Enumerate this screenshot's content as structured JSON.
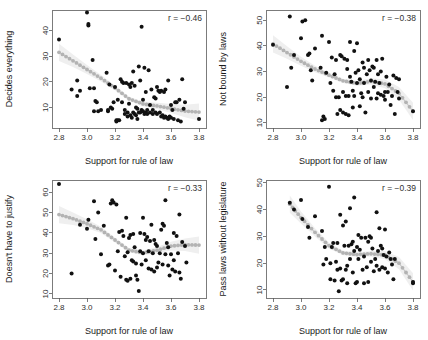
{
  "figure": {
    "type": "scatter-plot-matrix",
    "panel_count": 4,
    "background_color": "#ffffff",
    "point_color": "#111111",
    "smoother_color": "#b3b3b3"
  },
  "chart_data": [
    {
      "id": "decides-everything",
      "type": "scatter",
      "title": "",
      "xlabel": "Support for rule of law",
      "ylabel": "Decides everything",
      "annotation": "r = −0.46",
      "correlation": -0.46,
      "xlim": [
        2.75,
        3.85
      ],
      "ylim": [
        2,
        48
      ],
      "xticks": [
        "2.8",
        "3.0",
        "3.2",
        "3.4",
        "3.6",
        "3.8"
      ],
      "xtick_values": [
        2.8,
        3.0,
        3.2,
        3.4,
        3.6,
        3.8
      ],
      "yticks": [
        "10",
        "20",
        "30",
        "40"
      ],
      "ytick_values": [
        10,
        20,
        30,
        40
      ],
      "grid": false,
      "legend": "none",
      "x": [
        2.8,
        2.89,
        2.93,
        2.93,
        2.95,
        3.0,
        3.01,
        3.01,
        3.02,
        3.04,
        3.05,
        3.05,
        3.06,
        3.07,
        3.08,
        3.1,
        3.14,
        3.15,
        3.15,
        3.16,
        3.17,
        3.18,
        3.19,
        3.2,
        3.21,
        3.21,
        3.22,
        3.22,
        3.23,
        3.24,
        3.25,
        3.25,
        3.26,
        3.27,
        3.27,
        3.28,
        3.29,
        3.29,
        3.3,
        3.3,
        3.31,
        3.31,
        3.32,
        3.32,
        3.33,
        3.33,
        3.34,
        3.34,
        3.35,
        3.35,
        3.36,
        3.36,
        3.37,
        3.37,
        3.38,
        3.38,
        3.39,
        3.39,
        3.4,
        3.4,
        3.41,
        3.41,
        3.42,
        3.42,
        3.43,
        3.43,
        3.44,
        3.45,
        3.45,
        3.46,
        3.47,
        3.47,
        3.48,
        3.49,
        3.49,
        3.5,
        3.5,
        3.51,
        3.52,
        3.52,
        3.53,
        3.53,
        3.54,
        3.55,
        3.55,
        3.56,
        3.56,
        3.57,
        3.58,
        3.58,
        3.59,
        3.6,
        3.6,
        3.61,
        3.62,
        3.63,
        3.64,
        3.65,
        3.66,
        3.67,
        3.68,
        3.69,
        3.7,
        3.8
      ],
      "y": [
        36.5,
        17.0,
        20.5,
        14.5,
        16.5,
        47.0,
        42.0,
        42.5,
        17.5,
        28.5,
        17.5,
        8.5,
        12.5,
        12.0,
        8.5,
        9.0,
        23.5,
        8.5,
        9.0,
        19.0,
        10.0,
        9.5,
        12.0,
        18.0,
        5.0,
        4.5,
        5.0,
        13.0,
        5.0,
        21.0,
        20.0,
        12.0,
        19.5,
        9.0,
        7.5,
        19.5,
        8.0,
        6.5,
        19.0,
        11.5,
        18.0,
        7.0,
        19.5,
        6.0,
        8.0,
        24.0,
        18.5,
        7.5,
        10.0,
        7.0,
        9.5,
        5.5,
        26.0,
        8.0,
        20.5,
        8.0,
        41.5,
        9.0,
        13.0,
        8.5,
        25.5,
        7.5,
        16.0,
        8.0,
        9.0,
        7.5,
        24.5,
        11.0,
        8.0,
        17.0,
        9.0,
        7.5,
        14.0,
        13.5,
        8.0,
        18.0,
        7.5,
        16.5,
        16.0,
        8.0,
        16.5,
        6.5,
        7.0,
        16.0,
        6.0,
        17.0,
        6.5,
        6.0,
        20.5,
        5.5,
        6.5,
        11.0,
        6.0,
        9.0,
        5.5,
        12.0,
        12.0,
        5.0,
        13.0,
        4.5,
        21.0,
        9.5,
        12.0,
        5.5
      ],
      "smoother": {
        "x": [
          2.8,
          2.9,
          3.0,
          3.1,
          3.2,
          3.3,
          3.4,
          3.5,
          3.6,
          3.7,
          3.8
        ],
        "y": [
          31.5,
          28.2,
          24.8,
          21.4,
          17.6,
          13.4,
          11.4,
          10.6,
          9.6,
          8.6,
          8.2
        ]
      }
    },
    {
      "id": "not-bound-by-laws",
      "type": "scatter",
      "title": "",
      "xlabel": "Support for rule of law",
      "ylabel": "Not bound by laws",
      "annotation": "r = −0.38",
      "correlation": -0.38,
      "xlim": [
        2.75,
        3.85
      ],
      "ylim": [
        8,
        54
      ],
      "xticks": [
        "2.8",
        "3.0",
        "3.2",
        "3.4",
        "3.6",
        "3.8"
      ],
      "xtick_values": [
        2.8,
        3.0,
        3.2,
        3.4,
        3.6,
        3.8
      ],
      "yticks": [
        "10",
        "20",
        "30",
        "40",
        "50"
      ],
      "ytick_values": [
        10,
        20,
        30,
        40,
        50
      ],
      "grid": false,
      "legend": "none",
      "x": [
        2.8,
        2.9,
        2.92,
        2.93,
        2.95,
        3.0,
        3.01,
        3.03,
        3.05,
        3.06,
        3.07,
        3.08,
        3.1,
        3.14,
        3.15,
        3.15,
        3.16,
        3.17,
        3.18,
        3.2,
        3.21,
        3.22,
        3.23,
        3.24,
        3.25,
        3.25,
        3.26,
        3.27,
        3.28,
        3.28,
        3.29,
        3.3,
        3.3,
        3.31,
        3.32,
        3.32,
        3.33,
        3.33,
        3.34,
        3.34,
        3.35,
        3.35,
        3.36,
        3.37,
        3.37,
        3.38,
        3.38,
        3.39,
        3.4,
        3.4,
        3.41,
        3.42,
        3.42,
        3.43,
        3.44,
        3.44,
        3.45,
        3.45,
        3.46,
        3.47,
        3.48,
        3.48,
        3.49,
        3.5,
        3.5,
        3.51,
        3.52,
        3.52,
        3.53,
        3.54,
        3.54,
        3.55,
        3.55,
        3.56,
        3.57,
        3.57,
        3.58,
        3.59,
        3.6,
        3.6,
        3.61,
        3.62,
        3.63,
        3.64,
        3.65,
        3.66,
        3.67,
        3.68,
        3.69,
        3.7,
        3.7,
        3.8
      ],
      "y": [
        40.5,
        24.0,
        51.5,
        31.5,
        36.5,
        43.0,
        49.5,
        50.0,
        36.5,
        37.0,
        30.5,
        26.5,
        39.0,
        31.5,
        44.0,
        11.0,
        12.5,
        11.5,
        29.5,
        41.5,
        25.5,
        35.5,
        22.5,
        29.0,
        34.5,
        20.0,
        13.5,
        20.0,
        36.5,
        15.0,
        36.0,
        22.0,
        14.0,
        35.0,
        20.5,
        13.5,
        34.5,
        31.0,
        20.5,
        13.0,
        41.5,
        28.0,
        26.0,
        22.5,
        16.0,
        38.0,
        20.5,
        29.5,
        41.0,
        25.5,
        30.5,
        16.5,
        27.0,
        21.5,
        33.5,
        20.0,
        31.5,
        25.5,
        14.0,
        29.0,
        34.5,
        22.0,
        30.5,
        26.5,
        19.5,
        32.0,
        31.5,
        24.0,
        26.0,
        34.5,
        19.5,
        29.0,
        21.5,
        25.5,
        30.0,
        21.0,
        35.0,
        20.5,
        22.0,
        19.0,
        28.0,
        22.0,
        25.0,
        17.0,
        20.5,
        28.5,
        13.5,
        27.5,
        22.0,
        27.0,
        19.5,
        14.5
      ],
      "smoother": {
        "x": [
          2.8,
          2.9,
          3.0,
          3.1,
          3.2,
          3.3,
          3.4,
          3.5,
          3.6,
          3.7,
          3.8
        ],
        "y": [
          40.8,
          37.4,
          34.0,
          31.0,
          28.6,
          26.4,
          25.4,
          26.2,
          25.2,
          21.5,
          14.5
        ]
      }
    },
    {
      "id": "doesnt-have-to-justify",
      "type": "scatter",
      "title": "",
      "xlabel": "Support for rule of law",
      "ylabel": "Doesn't have to justify",
      "annotation": "r = −0.33",
      "correlation": -0.33,
      "xlim": [
        2.75,
        3.85
      ],
      "ylim": [
        8,
        66
      ],
      "xticks": [
        "2.8",
        "3.0",
        "3.2",
        "3.4",
        "3.6",
        "3.8"
      ],
      "xtick_values": [
        2.8,
        3.0,
        3.2,
        3.4,
        3.6,
        3.8
      ],
      "yticks": [
        "10",
        "20",
        "30",
        "40",
        "50",
        "60"
      ],
      "ytick_values": [
        10,
        20,
        30,
        40,
        50,
        60
      ],
      "grid": false,
      "legend": "none",
      "x": [
        2.8,
        2.89,
        2.95,
        3.0,
        3.01,
        3.05,
        3.06,
        3.08,
        3.1,
        3.12,
        3.15,
        3.16,
        3.17,
        3.18,
        3.19,
        3.2,
        3.21,
        3.22,
        3.23,
        3.24,
        3.25,
        3.26,
        3.27,
        3.28,
        3.28,
        3.29,
        3.29,
        3.3,
        3.31,
        3.31,
        3.32,
        3.33,
        3.33,
        3.34,
        3.35,
        3.35,
        3.36,
        3.37,
        3.38,
        3.38,
        3.39,
        3.4,
        3.4,
        3.41,
        3.42,
        3.42,
        3.43,
        3.44,
        3.44,
        3.45,
        3.46,
        3.46,
        3.47,
        3.48,
        3.48,
        3.49,
        3.5,
        3.5,
        3.51,
        3.52,
        3.53,
        3.54,
        3.54,
        3.55,
        3.56,
        3.56,
        3.57,
        3.58,
        3.58,
        3.59,
        3.6,
        3.61,
        3.62,
        3.62,
        3.63,
        3.64,
        3.65,
        3.66,
        3.66,
        3.67,
        3.68,
        3.7,
        3.71
      ],
      "y": [
        64.0,
        20.0,
        44.0,
        42.0,
        46.5,
        55.5,
        37.0,
        50.0,
        29.5,
        43.5,
        24.0,
        24.5,
        54.5,
        56.0,
        55.0,
        21.5,
        54.0,
        31.0,
        40.5,
        18.5,
        41.0,
        38.5,
        28.5,
        47.5,
        17.0,
        30.5,
        16.5,
        37.5,
        39.0,
        17.5,
        26.5,
        39.5,
        26.0,
        33.0,
        25.0,
        19.0,
        17.0,
        11.5,
        40.0,
        31.0,
        24.5,
        47.5,
        30.0,
        39.5,
        36.5,
        26.5,
        38.0,
        31.0,
        22.5,
        36.0,
        44.0,
        22.0,
        30.0,
        36.5,
        21.0,
        34.5,
        33.5,
        23.0,
        25.5,
        30.0,
        41.5,
        44.5,
        24.5,
        43.5,
        56.0,
        29.5,
        35.0,
        33.0,
        24.0,
        19.0,
        29.5,
        22.0,
        40.0,
        26.5,
        21.0,
        38.5,
        30.0,
        49.0,
        20.5,
        17.5,
        35.5,
        33.5,
        25.5
      ],
      "smoother": {
        "x": [
          2.8,
          2.9,
          3.0,
          3.1,
          3.2,
          3.3,
          3.4,
          3.5,
          3.6,
          3.7,
          3.8
        ],
        "y": [
          49.0,
          47.0,
          44.5,
          41.5,
          36.5,
          31.5,
          30.2,
          31.5,
          33.5,
          34.2,
          34.0
        ]
      }
    },
    {
      "id": "pass-laws-without-legislature",
      "type": "scatter",
      "title": "",
      "xlabel": "Support for rule of law",
      "ylabel": "Pass laws without legislature",
      "annotation": "r = −0.39",
      "correlation": -0.39,
      "xlim": [
        2.75,
        3.85
      ],
      "ylim": [
        7,
        51
      ],
      "xticks": [
        "2.8",
        "3.0",
        "3.2",
        "3.4",
        "3.6",
        "3.8"
      ],
      "xtick_values": [
        2.8,
        3.0,
        3.2,
        3.4,
        3.6,
        3.8
      ],
      "yticks": [
        "10",
        "20",
        "30",
        "40",
        "50"
      ],
      "ytick_values": [
        10,
        20,
        30,
        40,
        50
      ],
      "grid": false,
      "legend": "none",
      "x": [
        2.92,
        2.95,
        3.0,
        3.01,
        3.05,
        3.06,
        3.1,
        3.15,
        3.16,
        3.17,
        3.18,
        3.2,
        3.21,
        3.21,
        3.22,
        3.23,
        3.24,
        3.25,
        3.26,
        3.26,
        3.27,
        3.28,
        3.28,
        3.29,
        3.3,
        3.3,
        3.31,
        3.32,
        3.32,
        3.33,
        3.33,
        3.34,
        3.35,
        3.35,
        3.36,
        3.37,
        3.37,
        3.38,
        3.38,
        3.39,
        3.4,
        3.4,
        3.41,
        3.41,
        3.42,
        3.43,
        3.44,
        3.45,
        3.45,
        3.46,
        3.47,
        3.48,
        3.48,
        3.49,
        3.5,
        3.5,
        3.51,
        3.52,
        3.53,
        3.54,
        3.54,
        3.55,
        3.56,
        3.56,
        3.57,
        3.58,
        3.58,
        3.59,
        3.6,
        3.6,
        3.61,
        3.62,
        3.63,
        3.64,
        3.65,
        3.66,
        3.67,
        3.8,
        3.8
      ],
      "y": [
        42.5,
        40.0,
        43.5,
        36.5,
        33.5,
        29.5,
        37.5,
        32.0,
        19.5,
        26.0,
        21.5,
        48.5,
        20.0,
        14.0,
        26.0,
        27.5,
        13.5,
        20.5,
        27.5,
        17.5,
        9.5,
        38.0,
        18.0,
        13.5,
        34.0,
        14.0,
        26.5,
        35.5,
        17.5,
        12.5,
        19.0,
        26.5,
        40.5,
        21.5,
        27.0,
        28.0,
        16.5,
        44.5,
        24.5,
        12.5,
        26.0,
        13.0,
        30.5,
        21.5,
        25.0,
        29.5,
        17.5,
        22.5,
        12.5,
        29.5,
        18.5,
        28.0,
        13.0,
        30.0,
        29.5,
        20.5,
        25.5,
        17.0,
        21.5,
        39.0,
        19.0,
        24.5,
        33.0,
        17.5,
        26.5,
        25.5,
        18.5,
        23.0,
        32.5,
        18.0,
        22.5,
        16.5,
        24.0,
        21.5,
        19.5,
        14.0,
        21.5,
        13.0,
        12.5
      ],
      "smoother": {
        "x": [
          2.92,
          3.0,
          3.1,
          3.2,
          3.3,
          3.4,
          3.5,
          3.6,
          3.7,
          3.8
        ],
        "y": [
          42.0,
          37.0,
          31.5,
          26.5,
          23.8,
          23.2,
          23.5,
          23.0,
          20.0,
          13.0
        ]
      }
    }
  ]
}
